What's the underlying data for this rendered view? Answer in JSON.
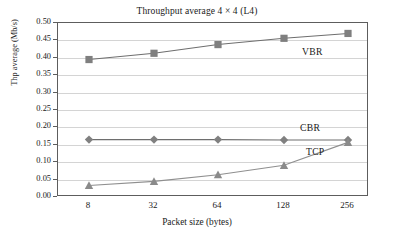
{
  "chart_data": {
    "type": "line",
    "title": "Throughput average 4 × 4 (L4)",
    "xlabel": "Packet size (bytes)",
    "ylabel": "Thp average (Mb/s)",
    "categories": [
      "8",
      "32",
      "64",
      "128",
      "256"
    ],
    "ylim": [
      0.0,
      0.5
    ],
    "ytick_step": 0.05,
    "yticks": [
      "0.50",
      "0.45",
      "0.40",
      "0.35",
      "0.30",
      "0.25",
      "0.20",
      "0.15",
      "0.10",
      "0.05",
      "0.00"
    ],
    "grid": true,
    "legend_position": "inline-right",
    "series": [
      {
        "name": "VBR",
        "marker": "square",
        "color": "#7f7f7f",
        "line_color": "#6e6e6e",
        "values": [
          0.395,
          0.413,
          0.438,
          0.456,
          0.47
        ]
      },
      {
        "name": "CBR",
        "marker": "diamond",
        "color": "#808080",
        "line_color": "#6e6e6e",
        "values": [
          0.165,
          0.165,
          0.165,
          0.164,
          0.164
        ]
      },
      {
        "name": "TCP",
        "marker": "triangle",
        "color": "#8a8a8a",
        "line_color": "#8f8f8f",
        "values": [
          0.033,
          0.045,
          0.064,
          0.091,
          0.157
        ]
      }
    ],
    "annotations": [
      {
        "text": "VBR",
        "series": "VBR"
      },
      {
        "text": "CBR",
        "series": "CBR"
      },
      {
        "text": "TCP",
        "series": "TCP"
      }
    ]
  },
  "colors": {
    "frame": "#5d5d5d",
    "grid": "#d4d4d4",
    "text": "#1a1a1a",
    "background": "#ffffff"
  }
}
